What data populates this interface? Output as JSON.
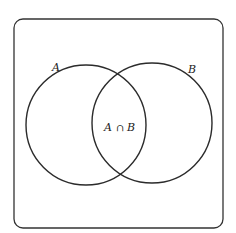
{
  "diagram": {
    "type": "venn",
    "universe": {
      "label": ""
    },
    "sets": [
      {
        "name": "A",
        "label": "A"
      },
      {
        "name": "B",
        "label": "B"
      }
    ],
    "intersection": {
      "label": "A ∩ B",
      "left": "A",
      "op": "∩",
      "right": "B"
    },
    "colors": {
      "stroke": "#2b2b2b",
      "background": "#ffffff"
    }
  }
}
